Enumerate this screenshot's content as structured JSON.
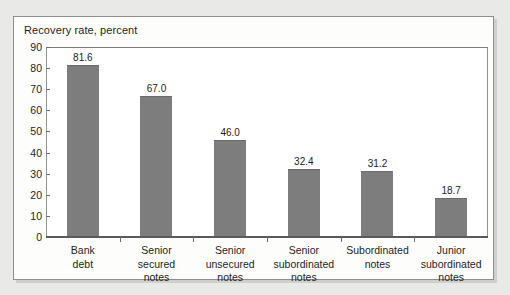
{
  "chart_data": {
    "type": "bar",
    "title": "Recovery rate, percent",
    "xlabel": "",
    "ylabel": "",
    "ylim": [
      0,
      90
    ],
    "ytick_step": 10,
    "yticks": [
      90,
      80,
      70,
      60,
      50,
      40,
      30,
      20,
      10,
      0
    ],
    "grid": false,
    "legend": "none",
    "bar_color": "#7d7d7d",
    "categories": [
      "Bank debt",
      "Senior secured notes",
      "Senior unsecured notes",
      "Senior subordinated notes",
      "Subordinated notes",
      "Junior subordinated notes"
    ],
    "category_lines": [
      [
        "Bank",
        "debt"
      ],
      [
        "Senior",
        "secured",
        "notes"
      ],
      [
        "Senior",
        "unsecured",
        "notes"
      ],
      [
        "Senior",
        "subordinated",
        "notes"
      ],
      [
        "Subordinated",
        "notes"
      ],
      [
        "Junior",
        "subordinated",
        "notes"
      ]
    ],
    "values": [
      81.6,
      67.0,
      46.0,
      32.4,
      31.2,
      18.7
    ],
    "value_labels": [
      "81.6",
      "67.0",
      "46.0",
      "32.4",
      "31.2",
      "18.7"
    ]
  },
  "colors": {
    "page_background": "#e9e9e7",
    "panel_background": "#fdfdfc",
    "panel_border": "#8d8d8d",
    "bar": "#7d7d7d",
    "axis": "#5a5a5a",
    "text": "#1d1d1d"
  }
}
